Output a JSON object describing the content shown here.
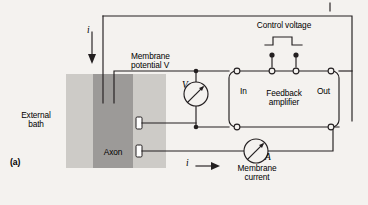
{
  "figure": {
    "panel_label": "(a)",
    "background_color": "#f4f2ef",
    "line_color": "#231f20",
    "text_color": "#000000"
  },
  "specimen": {
    "bath_label": "External\nbath",
    "bath_color": "#cdcbc7",
    "axon_label": "Axon",
    "axon_color": "#9c9a98",
    "electrode_color": "#ffffff"
  },
  "labels": {
    "membrane_potential": "Membrane\npotential V",
    "control_voltage": "Control voltage",
    "membrane_current": "Membrane\ncurrent",
    "feedback_amplifier": "Feedback\namplifier",
    "amp_in": "In",
    "amp_out": "Out",
    "current_in": "i",
    "current_out": "i",
    "voltmeter_symbol": "V",
    "ammeter_symbol": "A"
  },
  "meters": [
    {
      "name": "voltmeter",
      "symbol": "V",
      "caption": "Membrane\npotential V"
    },
    {
      "name": "ammeter",
      "symbol": "A",
      "caption": "Membrane\ncurrent"
    }
  ],
  "amplifier": {
    "title": "Feedback\namplifier",
    "terminals": [
      "In",
      "Out"
    ],
    "terminal_count": 6
  }
}
